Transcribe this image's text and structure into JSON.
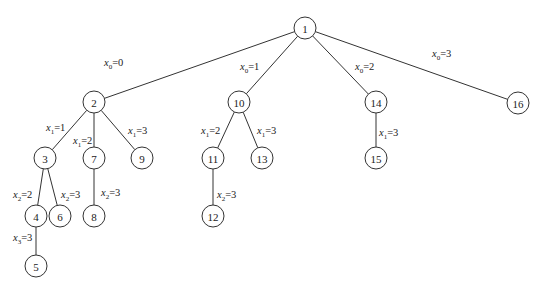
{
  "diagram": {
    "type": "search-tree",
    "node_radius": 11,
    "nodes": [
      {
        "id": "1",
        "x": 305,
        "y": 28
      },
      {
        "id": "2",
        "x": 94,
        "y": 102
      },
      {
        "id": "10",
        "x": 239,
        "y": 102
      },
      {
        "id": "14",
        "x": 376,
        "y": 102
      },
      {
        "id": "16",
        "x": 518,
        "y": 103
      },
      {
        "id": "3",
        "x": 45,
        "y": 158
      },
      {
        "id": "7",
        "x": 94,
        "y": 158
      },
      {
        "id": "9",
        "x": 142,
        "y": 158
      },
      {
        "id": "11",
        "x": 213,
        "y": 158
      },
      {
        "id": "13",
        "x": 262,
        "y": 158
      },
      {
        "id": "15",
        "x": 376,
        "y": 158
      },
      {
        "id": "4",
        "x": 36,
        "y": 216
      },
      {
        "id": "6",
        "x": 60,
        "y": 216
      },
      {
        "id": "8",
        "x": 94,
        "y": 216
      },
      {
        "id": "12",
        "x": 213,
        "y": 216
      },
      {
        "id": "5",
        "x": 36,
        "y": 266
      }
    ],
    "edges": [
      {
        "from": "1",
        "to": "2",
        "var": "x",
        "sub": "0",
        "value": "=0",
        "lx": 104,
        "ly": 66
      },
      {
        "from": "1",
        "to": "10",
        "var": "x",
        "sub": "0",
        "value": "=1",
        "lx": 240,
        "ly": 70
      },
      {
        "from": "1",
        "to": "14",
        "var": "x",
        "sub": "0",
        "value": "=2",
        "lx": 355,
        "ly": 70
      },
      {
        "from": "1",
        "to": "16",
        "var": "x",
        "sub": "0",
        "value": "=3",
        "lx": 432,
        "ly": 57
      },
      {
        "from": "2",
        "to": "3",
        "var": "x",
        "sub": "1",
        "value": "=1",
        "lx": 46,
        "ly": 131
      },
      {
        "from": "2",
        "to": "7",
        "var": "x",
        "sub": "1",
        "value": "=2",
        "lx": 73,
        "ly": 144
      },
      {
        "from": "2",
        "to": "9",
        "var": "x",
        "sub": "1",
        "value": "=3",
        "lx": 128,
        "ly": 134
      },
      {
        "from": "10",
        "to": "11",
        "var": "x",
        "sub": "1",
        "value": "=2",
        "lx": 201,
        "ly": 134
      },
      {
        "from": "10",
        "to": "13",
        "var": "x",
        "sub": "1",
        "value": "=3",
        "lx": 257,
        "ly": 134
      },
      {
        "from": "14",
        "to": "15",
        "var": "x",
        "sub": "1",
        "value": "=3",
        "lx": 379,
        "ly": 136
      },
      {
        "from": "3",
        "to": "4",
        "var": "x",
        "sub": "2",
        "value": "=2",
        "lx": 13,
        "ly": 198
      },
      {
        "from": "3",
        "to": "6",
        "var": "x",
        "sub": "2",
        "value": "=3",
        "lx": 61,
        "ly": 198
      },
      {
        "from": "7",
        "to": "8",
        "var": "x",
        "sub": "2",
        "value": "=3",
        "lx": 101,
        "ly": 196
      },
      {
        "from": "11",
        "to": "12",
        "var": "x",
        "sub": "2",
        "value": "=3",
        "lx": 217,
        "ly": 198
      },
      {
        "from": "4",
        "to": "5",
        "var": "x",
        "sub": "3",
        "value": "=3",
        "lx": 13,
        "ly": 241
      }
    ]
  }
}
